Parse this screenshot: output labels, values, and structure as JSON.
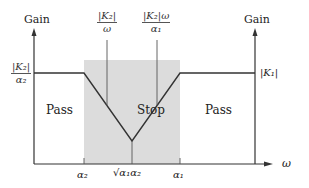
{
  "diagram": {
    "type": "band-stop filter gain plot",
    "left_axis_label": "Gain",
    "right_axis_label": "Gain",
    "x_axis_label": "ω",
    "left_gain_label": {
      "numerator": "|K₂|",
      "denominator": "α₂"
    },
    "right_gain_label": "|K₁|",
    "marker_left": {
      "numerator": "|K₂|",
      "denominator": "ω"
    },
    "marker_right": {
      "numerator": "|K₂|ω",
      "denominator": "α₁"
    },
    "regions": [
      {
        "label": "Pass",
        "position": "left"
      },
      {
        "label": "Stop",
        "position": "center",
        "shaded": true
      },
      {
        "label": "Pass",
        "position": "right"
      }
    ],
    "x_ticks": [
      "α₂",
      "√α₁α₂",
      "α₁"
    ],
    "colors": {
      "stop_band_fill": "#dcdcdc",
      "line": "#333333"
    }
  }
}
